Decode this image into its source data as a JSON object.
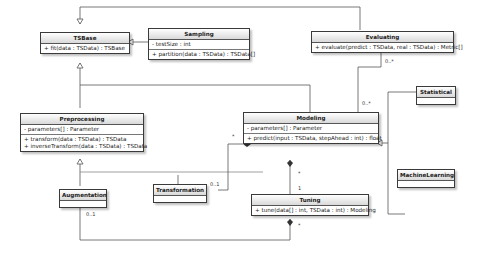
{
  "classes": {
    "tsbase": {
      "name": "TSBase",
      "attributes": [],
      "operations": [
        "+ fit(data : TSData) : TSBase"
      ]
    },
    "sampling": {
      "name": "Sampling",
      "attributes": [
        "- testSize : int"
      ],
      "operations": [
        "+ partition(data : TSData) : TSData[]"
      ]
    },
    "evaluating": {
      "name": "Evaluating",
      "attributes": [],
      "operations": [
        "+ evaluate(predict : TSData, real : TSData) : Metric[]"
      ]
    },
    "preprocessing": {
      "name": "Preprocessing",
      "attributes": [
        "- parameters[] : Parameter"
      ],
      "operations": [
        "+ transform(data : TSData) : TSData",
        "+ inverseTransform(data : TSData) : TSData"
      ]
    },
    "modeling": {
      "name": "Modeling",
      "attributes": [
        "- parameters[] : Parameter"
      ],
      "operations": [
        "+ predict(input : TSData, stepAhead : int) : float"
      ]
    },
    "statistical": {
      "name": "Statistical"
    },
    "machinelearning": {
      "name": "MachineLearning"
    },
    "augmentation": {
      "name": "Augmentation"
    },
    "transformation": {
      "name": "Transformation"
    },
    "tuning": {
      "name": "Tuning",
      "attributes": [],
      "operations": [
        "+ tune(data[] : int, TSData : int) : Modeling"
      ]
    }
  },
  "multiplicities": {
    "evaluating_bottom": "0..*",
    "modeling_top": "0..*",
    "modeling_left": "*",
    "transformation_right": "0..1",
    "modeling_bottom": "*",
    "tuning_top": "1",
    "tuning_bottom": "*",
    "augmentation_bottom": "0..1"
  }
}
